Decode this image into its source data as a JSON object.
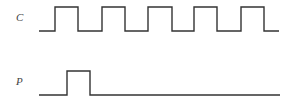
{
  "diagram": {
    "type": "timing-diagram",
    "stroke_color": "#333333",
    "signals": [
      {
        "name": "C",
        "label": "C",
        "description": "clock signal, 5 pulses",
        "points": "39,31 55,31 55,7 78,7 78,31 102,31 102,7 125,7 125,31 148,31 148,7 172,7 172,31 194,31 194,7 217,7 217,31 241,31 241,7 264,7 264,31 279,31"
      },
      {
        "name": "P",
        "label": "P",
        "description": "single pulse aligned with first clock pulse",
        "points": "39,95 67,95 67,71 90,71 90,95 280,95"
      }
    ]
  }
}
